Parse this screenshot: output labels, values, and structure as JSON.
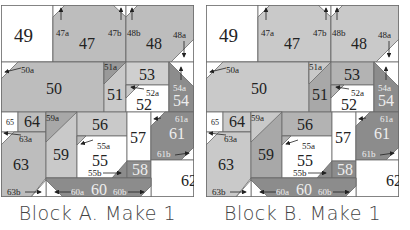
{
  "colors": {
    "white": "#ffffff",
    "light": "#c9c9c9",
    "medium": "#b3b3b3",
    "dark": "#8c8c8c",
    "outline": "#6a6a6a",
    "text_dark": "#222222",
    "text_light": "#eeeeee"
  },
  "blocks": [
    {
      "id": "A",
      "caption": "Block A.  Make 1",
      "pieces": {
        "p49": "49",
        "p47": "47",
        "p47a": "47a",
        "p47b": "47b",
        "p48": "48",
        "p48a": "48a",
        "p48b": "48b",
        "p50": "50",
        "p50a": "50a",
        "p51": "51",
        "p51a": "51a",
        "p52": "52",
        "p52a": "52a",
        "p53": "53",
        "p54": "54",
        "p54a": "54a",
        "p55": "55",
        "p55a": "55a",
        "p55b": "55b",
        "p56": "56",
        "p57": "57",
        "p58": "58",
        "p59": "59",
        "p59a": "59a",
        "p60": "60",
        "p60a": "60a",
        "p60b": "60b",
        "p61": "61",
        "p61a": "61a",
        "p61b": "61b",
        "p62": "62",
        "p63": "63",
        "p63a": "63a",
        "p63b": "63b",
        "p64": "64",
        "p65": "65"
      }
    },
    {
      "id": "B",
      "caption": "Block B.  Make 1",
      "pieces": {
        "p49": "49",
        "p47": "47",
        "p47a": "47a",
        "p47b": "47b",
        "p48": "48",
        "p48a": "48a",
        "p48b": "48b",
        "p50": "50",
        "p50a": "50a",
        "p51": "51",
        "p51a": "51a",
        "p52": "52",
        "p52a": "52a",
        "p53": "53",
        "p54": "54",
        "p54a": "54a",
        "p55": "55",
        "p55a": "55a",
        "p55b": "55b",
        "p56": "56",
        "p57": "57",
        "p58": "58",
        "p59": "59",
        "p59a": "59a",
        "p60": "60",
        "p60a": "60a",
        "p60b": "60b",
        "p61": "61",
        "p61a": "61a",
        "p61b": "61b",
        "p62": "62",
        "p63": "63",
        "p63a": "63a",
        "p63b": "63b",
        "p64": "64",
        "p65": "65"
      }
    }
  ]
}
